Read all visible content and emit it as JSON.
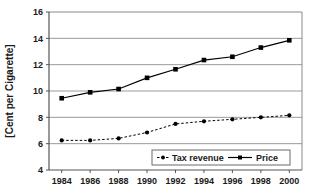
{
  "chart_data": {
    "type": "line",
    "title": "",
    "xlabel": "",
    "ylabel": "[Cent per Cigarette]",
    "x": [
      1984,
      1986,
      1988,
      1990,
      1992,
      1994,
      1996,
      1998,
      2000
    ],
    "categories": [
      "1984",
      "1986",
      "1988",
      "1990",
      "1992",
      "1994",
      "1996",
      "1998",
      "2000"
    ],
    "series": [
      {
        "name": "Tax revenue",
        "values": [
          6.25,
          6.25,
          6.4,
          6.85,
          7.5,
          7.7,
          7.85,
          8.0,
          8.15
        ],
        "line_style": "dashed",
        "marker": "circle",
        "color": "#000000"
      },
      {
        "name": "Price",
        "values": [
          9.45,
          9.9,
          10.15,
          11.0,
          11.65,
          12.35,
          12.6,
          13.3,
          13.85
        ],
        "line_style": "solid",
        "marker": "square",
        "color": "#000000"
      }
    ],
    "ylim": [
      4,
      16
    ],
    "yticks": [
      4,
      6,
      8,
      10,
      12,
      14,
      16
    ],
    "ytick_labels": [
      "4",
      "6",
      "8",
      "10",
      "12",
      "14",
      "16"
    ],
    "xlim": [
      1983,
      2001
    ],
    "grid": "horizontal",
    "legend_position": "bottom-center",
    "legend_entries": [
      "Tax revenue",
      "Price"
    ],
    "gridline_color": "#808080",
    "axis_color": "#808080",
    "plot_background": "#ffffff"
  }
}
